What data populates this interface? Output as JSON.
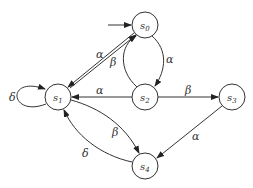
{
  "diagram": {
    "type": "state-transition-graph",
    "initial_state": "s0",
    "nodes": [
      {
        "id": "s0",
        "label": "s",
        "sub": "0"
      },
      {
        "id": "s1",
        "label": "s",
        "sub": "1"
      },
      {
        "id": "s2",
        "label": "s",
        "sub": "2"
      },
      {
        "id": "s3",
        "label": "s",
        "sub": "3"
      },
      {
        "id": "s4",
        "label": "s",
        "sub": "4"
      }
    ],
    "edges": [
      {
        "from": "s0",
        "to": "s1",
        "label": "α"
      },
      {
        "from": "s1",
        "to": "s0",
        "label": "β"
      },
      {
        "from": "s0",
        "to": "s2",
        "label": "α"
      },
      {
        "from": "s2",
        "to": "s0",
        "label": "β"
      },
      {
        "from": "s2",
        "to": "s1",
        "label": "α"
      },
      {
        "from": "s2",
        "to": "s3",
        "label": "β"
      },
      {
        "from": "s3",
        "to": "s4",
        "label": "α"
      },
      {
        "from": "s1",
        "to": "s4",
        "label": "β"
      },
      {
        "from": "s4",
        "to": "s1",
        "label": "δ"
      },
      {
        "from": "s1",
        "to": "s1",
        "label": "δ"
      }
    ]
  }
}
